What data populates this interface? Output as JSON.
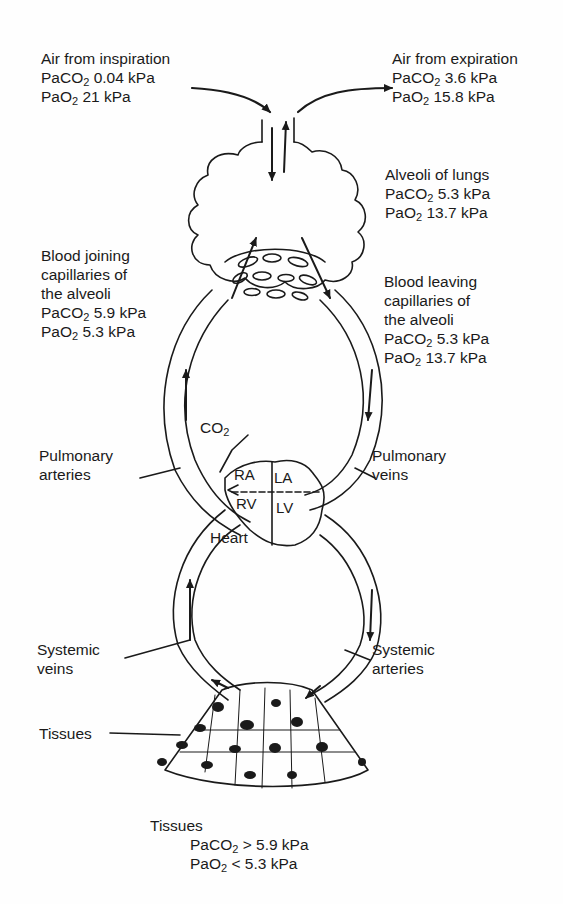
{
  "inspiration": {
    "title": "Air from inspiration",
    "co2_prefix": "PaCO",
    "co2_sub": "2",
    "co2_value": " 0.04 kPa",
    "o2_prefix": "PaO",
    "o2_sub": "2",
    "o2_value": " 21 kPa"
  },
  "expiration": {
    "title": "Air from expiration",
    "co2_prefix": "PaCO",
    "co2_sub": "2",
    "co2_value": " 3.6 kPa",
    "o2_prefix": "PaO",
    "o2_sub": "2",
    "o2_value": " 15.8 kPa"
  },
  "alveoli": {
    "title": "Alveoli of lungs",
    "co2_prefix": "PaCO",
    "co2_sub": "2",
    "co2_value": " 5.3 kPa",
    "o2_prefix": "PaO",
    "o2_sub": "2",
    "o2_value": " 13.7 kPa"
  },
  "blood_joining": {
    "line1": "Blood joining",
    "line2": "capillaries of",
    "line3": "the alveoli",
    "co2_prefix": "PaCO",
    "co2_sub": "2",
    "co2_value": " 5.9 kPa",
    "o2_prefix": "PaO",
    "o2_sub": "2",
    "o2_value": " 5.3 kPa"
  },
  "blood_leaving": {
    "line1": "Blood leaving",
    "line2": "capillaries of",
    "line3": "the alveoli",
    "co2_prefix": "PaCO",
    "co2_sub": "2",
    "co2_value": " 5.3 kPa",
    "o2_prefix": "PaO",
    "o2_sub": "2",
    "o2_value": " 13.7 kPa"
  },
  "co2_label": {
    "prefix": "CO",
    "sub": "2"
  },
  "pulmonary_arteries": {
    "line1": "Pulmonary",
    "line2": "arteries"
  },
  "pulmonary_veins": {
    "line1": "Pulmonary",
    "line2": "veins"
  },
  "heart": {
    "label": "Heart",
    "ra": "RA",
    "la": "LA",
    "rv": "RV",
    "lv": "LV"
  },
  "systemic_veins": {
    "line1": "Systemic",
    "line2": "veins"
  },
  "systemic_arteries": {
    "line1": "Systemic",
    "line2": "arteries"
  },
  "tissues_label": "Tissues",
  "tissues_values": {
    "title": "Tissues",
    "co2_prefix": "PaCO",
    "co2_sub": "2",
    "co2_value": " > 5.9 kPa",
    "o2_prefix": "PaO",
    "o2_sub": "2",
    "o2_value": " < 5.3 kPa"
  }
}
